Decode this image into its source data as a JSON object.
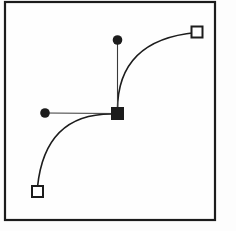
{
  "figure": {
    "colors": {
      "stroke": "#1c1c1c",
      "handle_stroke": "#3a3a3a",
      "canvas_fill": "#fefefe",
      "endpoint_fill": "#ffffff",
      "background": "#fdfdfd"
    },
    "canvas": {
      "x": 5,
      "y": 2,
      "width": 210,
      "height": 218,
      "stroke_width": 2.2
    },
    "curve_stroke_width": 1.6,
    "handle_stroke_width": 1.1,
    "curves": [
      {
        "name": "upper-curve",
        "from": [
          196,
          32.5
        ],
        "control": [
          117.5,
          40
        ],
        "to": [
          117.5,
          110
        ]
      },
      {
        "name": "lower-curve",
        "from": [
          113,
          114
        ],
        "control": [
          45,
          113
        ],
        "to": [
          37.5,
          187
        ]
      }
    ],
    "handles": [
      {
        "name": "vertical-handle-line",
        "from": [
          117.5,
          113.5
        ],
        "to": [
          117.5,
          40
        ]
      },
      {
        "name": "horizontal-handle-line",
        "from": [
          117.5,
          113.5
        ],
        "to": [
          45,
          113
        ]
      }
    ],
    "control_points": [
      {
        "name": "top-control-point",
        "cx": 117.5,
        "cy": 40,
        "r": 4.8
      },
      {
        "name": "left-control-point",
        "cx": 45,
        "cy": 113,
        "r": 4.8
      }
    ],
    "anchor_point": {
      "name": "anchor-point",
      "cx": 117.5,
      "cy": 113.5,
      "size": 13
    },
    "endpoints": [
      {
        "name": "top-right-endpoint",
        "cx": 197,
        "cy": 32,
        "size": 11,
        "stroke_width": 2
      },
      {
        "name": "bottom-left-endpoint",
        "cx": 37.5,
        "cy": 191.5,
        "size": 11,
        "stroke_width": 2
      }
    ]
  }
}
